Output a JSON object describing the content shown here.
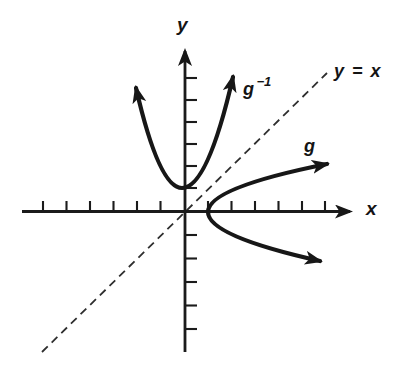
{
  "figure": {
    "background_color": "#ffffff",
    "ink_color": "#1b1b1b",
    "labels": {
      "y_axis": "y",
      "x_axis": "x",
      "identity_line": "y = x",
      "g_curve": "g",
      "g_inverse_base": "g",
      "g_inverse_exponent": "−1"
    },
    "axes": {
      "x_ticks_left_of_origin": 6,
      "x_ticks_right_of_origin": 6,
      "y_ticks_above_origin": 6,
      "y_ticks_below_origin": 5,
      "tick_labels_shown": false
    },
    "curves": {
      "g": {
        "label": "g",
        "shape": "rightward-opening parabola",
        "vertex_units": [
          1,
          0
        ],
        "branch_ends": "arrowheads on both branches"
      },
      "g_inverse": {
        "label": "g−1",
        "shape": "upward-opening parabola",
        "vertex_units": [
          0,
          1
        ],
        "branch_ends": "arrowheads on both branches"
      },
      "identity": {
        "label": "y = x",
        "style": "dashed",
        "passes_through_origin": true
      }
    }
  }
}
